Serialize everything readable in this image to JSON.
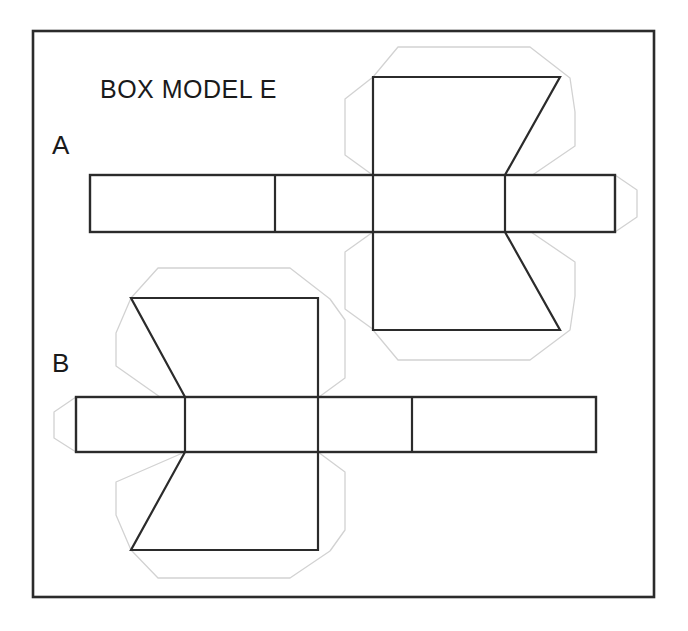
{
  "page": {
    "background_color": "#ffffff",
    "width": 688,
    "height": 631
  },
  "frame": {
    "name": "outer-border",
    "x": 33,
    "y": 31,
    "width": 621,
    "height": 566,
    "stroke_color": "#2b2b2b",
    "stroke_width": 2.6
  },
  "title": {
    "text": "BOX MODEL E",
    "x": 100,
    "y": 98
  },
  "labels": [
    {
      "text": "A",
      "x": 52,
      "y": 154
    },
    {
      "text": "B",
      "x": 52,
      "y": 372
    }
  ],
  "styles": {
    "dark_stroke": "#2b2b2b",
    "dark_stroke_width": 2.2,
    "light_stroke": "#d2d2d2",
    "light_stroke_width": 1.3,
    "fill": "none"
  },
  "figures": [
    {
      "id": "figure-a",
      "label": "A",
      "description": "Box net with horizontal four-panel strip and two hexagonal end flaps pointing right",
      "strip": {
        "x": 90,
        "y": 175,
        "width": 525,
        "height": 57,
        "dividers_x": [
          275,
          373,
          505
        ]
      },
      "end_tab": {
        "points": "615,175 637,190 637,217 615,232"
      },
      "flaps": [
        {
          "name": "top-flap-dark",
          "points": "373,77 560,77 505,175 373,175"
        },
        {
          "name": "bottom-flap-dark",
          "points": "373,232 505,232 560,330 373,330"
        }
      ],
      "guides": [
        {
          "name": "top-flap-outline",
          "points": "373,77 345,98 345,155 373,175"
        },
        {
          "name": "top-flap-outline-upper",
          "points": "373,77 398,47 530,47 570,77"
        },
        {
          "name": "top-flap-outline-right",
          "points": "560,77 575,112 575,145 531,175"
        },
        {
          "name": "top-flap-outline-right2",
          "points": "570,77 575,112"
        },
        {
          "name": "top-flap-outline-left-close",
          "points": "345,155 373,175"
        },
        {
          "name": "bottom-flap-outline",
          "points": "373,232 345,252 345,310 373,330"
        },
        {
          "name": "bottom-flap-outline-lower",
          "points": "373,330 398,360 530,360 570,330"
        },
        {
          "name": "bottom-flap-outline-right",
          "points": "505,232 575,262 575,295 570,330"
        },
        {
          "name": "end-tab-outline",
          "points": "615,175 637,190 637,217 615,232"
        }
      ]
    },
    {
      "id": "figure-b",
      "label": "B",
      "description": "Mirror image box net with horizontal four-panel strip and two hexagonal end flaps pointing left",
      "strip": {
        "x": 76,
        "y": 397,
        "width": 520,
        "height": 55,
        "dividers_x": [
          185,
          318,
          412
        ]
      },
      "end_tab": {
        "points": "76,397 54,412 54,438 76,452"
      },
      "flaps": [
        {
          "name": "top-flap-dark",
          "points": "131,298 318,298 318,397 185,397"
        },
        {
          "name": "bottom-flap-dark",
          "points": "185,452 318,452 318,550 131,550"
        }
      ],
      "guides": [
        {
          "name": "top-flap-outline-upper",
          "points": "131,298 158,268 290,268 330,298"
        },
        {
          "name": "top-flap-outline-left",
          "points": "131,298 116,333 116,366 160,397"
        },
        {
          "name": "top-flap-outline-right",
          "points": "330,298 345,320 345,378 318,397"
        },
        {
          "name": "top-flap-outline-left-close",
          "points": "160,397 185,397"
        },
        {
          "name": "bottom-flap-outline-left",
          "points": "185,452 116,482 116,515 131,550"
        },
        {
          "name": "bottom-flap-outline-lower",
          "points": "131,550 158,578 290,578 330,550"
        },
        {
          "name": "bottom-flap-outline-right",
          "points": "318,452 345,472 345,530 330,550"
        },
        {
          "name": "end-tab-outline",
          "points": "76,397 54,412 54,438 76,452"
        }
      ]
    }
  ]
}
